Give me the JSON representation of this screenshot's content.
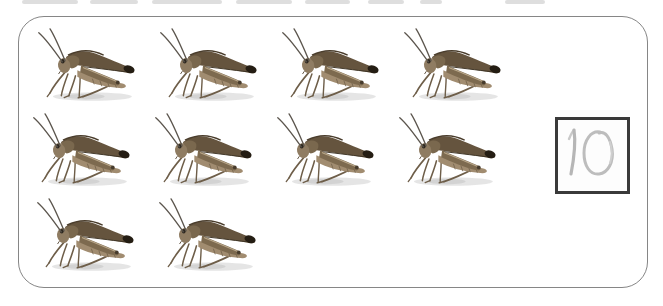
{
  "exercise": {
    "type": "counting-worksheet",
    "subject": "grasshopper",
    "rows": [
      4,
      4,
      2
    ],
    "total_items": 10,
    "answer": {
      "value": "10",
      "style": "handwritten-pencil"
    }
  },
  "colors": {
    "background": "#ffffff",
    "frame_border": "#868686",
    "answer_box_border": "#3a3a3a",
    "pencil_stroke": "#bcbcbc",
    "grasshopper_body": "#8f7c62",
    "grasshopper_wing": "#65543e",
    "grasshopper_wing_tip": "#241d13"
  },
  "icons": {
    "grasshopper": "grasshopper-photo"
  }
}
